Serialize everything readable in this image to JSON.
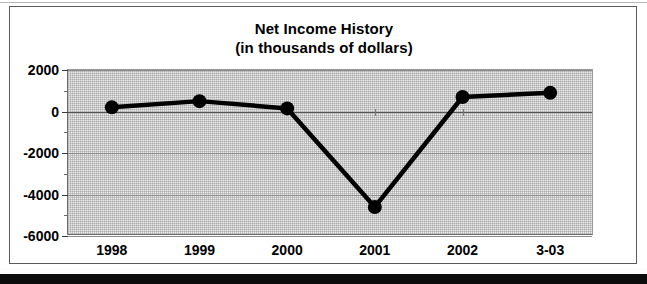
{
  "figure": {
    "title_line1": "Net Income History",
    "title_line2": "(in thousands of dollars)"
  },
  "chart_data": {
    "type": "line",
    "title": "Net Income History (in thousands of dollars)",
    "xlabel": "",
    "ylabel": "",
    "categories": [
      "1998",
      "1999",
      "2000",
      "2001",
      "2002",
      "3-03"
    ],
    "values": [
      200,
      500,
      150,
      -4600,
      700,
      900
    ],
    "ylim": [
      -6000,
      2000
    ],
    "ytick_labels": [
      "2000",
      "0",
      "-2000",
      "-4000",
      "-6000"
    ],
    "ytick_values": [
      2000,
      0,
      -2000,
      -4000,
      -6000
    ],
    "yminor_step": 1000,
    "grid": true,
    "legend": "none",
    "marker": "filled-circle",
    "line_color": "#000000",
    "marker_color": "#000000",
    "plot_background": "#e9e9e9"
  }
}
